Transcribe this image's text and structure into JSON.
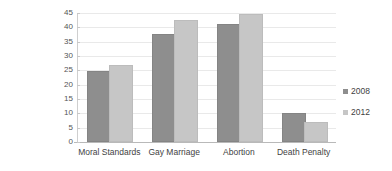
{
  "chart_data": {
    "type": "bar",
    "title": "",
    "subtitle": "",
    "xlabel": "",
    "ylabel": "Religion Gap (%)",
    "ylim": [
      0,
      45
    ],
    "ytick_step": 5,
    "yticks": [
      45,
      40,
      35,
      30,
      25,
      20,
      15,
      10,
      5,
      0
    ],
    "grid": true,
    "legend_position": "right",
    "categories": [
      "Moral Standards",
      "Gay Marriage",
      "Abortion",
      "Death Penalty"
    ],
    "series": [
      {
        "name": "2008",
        "color": "#8e8e8e",
        "values": [
          24,
          37,
          40.5,
          9.3
        ]
      },
      {
        "name": "2012",
        "color": "#c6c6c6",
        "values": [
          26,
          42,
          44,
          6.2
        ]
      }
    ],
    "annotations": []
  },
  "legend": {
    "items": [
      {
        "label": "2008",
        "color": "#8e8e8e"
      },
      {
        "label": "2012",
        "color": "#c6c6c6"
      }
    ]
  }
}
